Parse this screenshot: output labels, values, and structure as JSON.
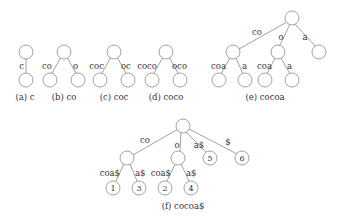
{
  "figure": {
    "subfigures": [
      {
        "id": "a",
        "caption": "(a) c",
        "edges": [
          "c"
        ]
      },
      {
        "id": "b",
        "caption": "(b) co",
        "edges": [
          "co",
          "o"
        ]
      },
      {
        "id": "c",
        "caption": "(c) coc",
        "edges": [
          "coc",
          "oc"
        ]
      },
      {
        "id": "d",
        "caption": "(d) coco",
        "edges": [
          "coco",
          "oco"
        ]
      },
      {
        "id": "e",
        "caption": "(e) cocoa",
        "edges": [
          "co",
          "o",
          "a",
          "coa",
          "a",
          "coa",
          "a"
        ]
      },
      {
        "id": "f",
        "caption": "(f) cocoa$",
        "edges": [
          "co",
          "o",
          "a$",
          "$",
          "coa$",
          "a$",
          "coa$",
          "a$"
        ],
        "leaf_numbers": [
          "1",
          "3",
          "2",
          "4",
          "5",
          "6"
        ]
      }
    ]
  }
}
